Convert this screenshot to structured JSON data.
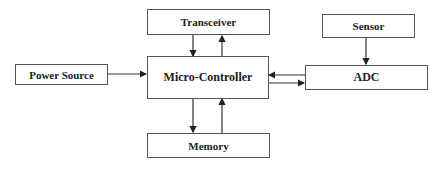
{
  "diagram": {
    "type": "block-diagram",
    "colors": {
      "line": "#333333",
      "border": "#555555",
      "text": "#222222",
      "background": "#ffffff"
    },
    "nodes": {
      "transceiver": {
        "label": "Transceiver"
      },
      "sensor": {
        "label": "Sensor"
      },
      "power_source": {
        "label": "Power Source"
      },
      "micro_controller": {
        "label": "Micro-Controller"
      },
      "adc": {
        "label": "ADC"
      },
      "memory": {
        "label": "Memory"
      }
    },
    "edges": [
      {
        "from": "Transceiver",
        "to": "Micro-Controller"
      },
      {
        "from": "Micro-Controller",
        "to": "Transceiver"
      },
      {
        "from": "Power Source",
        "to": "Micro-Controller"
      },
      {
        "from": "Sensor",
        "to": "ADC"
      },
      {
        "from": "ADC",
        "to": "Micro-Controller"
      },
      {
        "from": "Micro-Controller",
        "to": "ADC"
      },
      {
        "from": "Micro-Controller",
        "to": "Memory"
      },
      {
        "from": "Memory",
        "to": "Micro-Controller"
      }
    ]
  }
}
